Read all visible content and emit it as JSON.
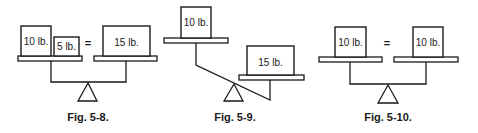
{
  "figures": [
    {
      "caption": "Fig. 5-8.",
      "left_weights": [
        "10 lb.",
        "5 lb."
      ],
      "equals": "=",
      "right_weights": [
        "15 lb."
      ],
      "state": "balanced"
    },
    {
      "caption": "Fig. 5-9.",
      "left_weights": [
        "10 lb."
      ],
      "right_weights": [
        "15 lb."
      ],
      "state": "unbalanced-right-heavy"
    },
    {
      "caption": "Fig. 5-10.",
      "left_weights": [
        "10 lb."
      ],
      "equals": "=",
      "right_weights": [
        "10 lb."
      ],
      "state": "balanced"
    }
  ],
  "colors": {
    "ink": "#1a1a1a",
    "background": "#ffffff"
  }
}
